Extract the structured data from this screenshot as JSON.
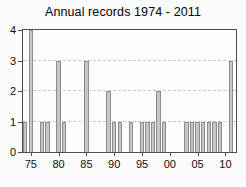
{
  "chart_data": {
    "type": "bar",
    "title": "Annual records 1974 - 2011",
    "xlabel": "",
    "ylabel": "",
    "x": [
      1974,
      1975,
      1977,
      1978,
      1980,
      1981,
      1985,
      1989,
      1990,
      1991,
      1993,
      1995,
      1996,
      1997,
      1998,
      1999,
      2003,
      2004,
      2005,
      2006,
      2007,
      2008,
      2009,
      2011
    ],
    "values": [
      1,
      4,
      1,
      1,
      3,
      1,
      3,
      2,
      1,
      1,
      1,
      1,
      1,
      1,
      2,
      1,
      1,
      1,
      1,
      1,
      1,
      1,
      1,
      3
    ],
    "xlim": [
      1973.6,
      2011.9
    ],
    "ylim": [
      0,
      4
    ],
    "x_tick_values": [
      1975,
      1980,
      1985,
      1990,
      1995,
      2000,
      2005,
      2010
    ],
    "x_tick_labels": [
      "75",
      "80",
      "85",
      "90",
      "95",
      "00",
      "05",
      "10"
    ],
    "y_tick_values": [
      0,
      1,
      2,
      3,
      4
    ],
    "y_tick_labels": [
      "0",
      "1",
      "2",
      "3",
      "4"
    ],
    "grid": "horizontal-dashed-at-1-2-3",
    "legend": "none",
    "colors": {
      "bar_fill": "#c6c6c6",
      "bar_border": "#8d8d8d",
      "axis_box": "#4e4e4e",
      "grid_line": "#c7c7c7",
      "text": "#101010",
      "figure_background": "#fbfbfb",
      "plot_background": "#fdfdfd"
    }
  }
}
